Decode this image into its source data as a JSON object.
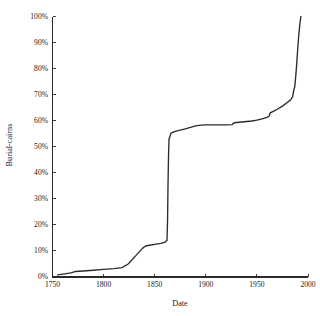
{
  "chart_data": {
    "type": "line",
    "title": "",
    "subtitle": "",
    "xlabel": "Date",
    "ylabel": "Burial-cairns",
    "xlim": [
      1750,
      2000
    ],
    "ylim": [
      0,
      100
    ],
    "grid": false,
    "legend": null,
    "legend_position": "none",
    "x_tick_labels": [
      "1750",
      "1800",
      "1850",
      "1900",
      "1950",
      "2000"
    ],
    "x_ticks": [
      1750,
      1800,
      1850,
      1900,
      1950,
      2000
    ],
    "y_tick_labels": [
      "0%",
      "10%",
      "20%",
      "30%",
      "40%",
      "50%",
      "60%",
      "70%",
      "80%",
      "90%",
      "100%"
    ],
    "y_ticks": [
      0,
      10,
      20,
      30,
      40,
      50,
      60,
      70,
      80,
      90,
      100
    ],
    "series": [
      {
        "name": "Cumulative burial-cairns excavated",
        "color": "#2b2b2b",
        "x": [
          1755,
          1762,
          1768,
          1772,
          1780,
          1790,
          1800,
          1810,
          1818,
          1824,
          1832,
          1838,
          1841,
          1845,
          1850,
          1856,
          1860,
          1862,
          1862.6,
          1863,
          1863.5,
          1864,
          1866,
          1870,
          1875,
          1880,
          1885,
          1890,
          1895,
          1900,
          1910,
          1920,
          1926,
          1927,
          1930,
          1935,
          1940,
          1945,
          1950,
          1955,
          1960,
          1962,
          1963,
          1966,
          1970,
          1975,
          1980,
          1983,
          1985,
          1986,
          1987,
          1988,
          1989,
          1990,
          1991,
          1992,
          1993
        ],
        "y": [
          0.8,
          1.2,
          1.6,
          2.1,
          2.3,
          2.6,
          2.9,
          3.2,
          3.6,
          5.0,
          8.4,
          11.0,
          11.9,
          12.2,
          12.5,
          12.9,
          13.4,
          14.0,
          22.0,
          35.0,
          46.0,
          53.0,
          55.2,
          55.9,
          56.4,
          56.9,
          57.4,
          58.0,
          58.3,
          58.4,
          58.4,
          58.4,
          58.5,
          59.1,
          59.3,
          59.5,
          59.7,
          59.9,
          60.2,
          60.7,
          61.3,
          61.8,
          63.0,
          63.6,
          64.4,
          65.6,
          67.1,
          68.0,
          69.2,
          71.6,
          73.0,
          77.0,
          82.0,
          88.0,
          93.0,
          97.0,
          100.0
        ]
      }
    ],
    "annotations": []
  },
  "axes": {
    "y_title": "Burial-cairns",
    "x_title": "Date"
  }
}
